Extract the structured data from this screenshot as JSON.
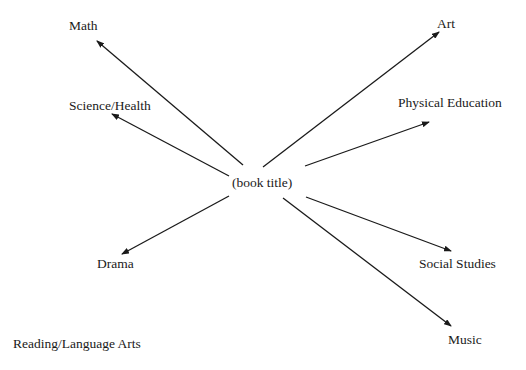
{
  "diagram": {
    "type": "web",
    "center": {
      "label": "(book title)",
      "x": 232,
      "y": 176
    },
    "nodes": [
      {
        "id": "math",
        "label": "Math",
        "x": 69,
        "y": 19
      },
      {
        "id": "science",
        "label": "Science/Health",
        "x": 69,
        "y": 99
      },
      {
        "id": "art",
        "label": "Art",
        "x": 437,
        "y": 17
      },
      {
        "id": "pe",
        "label": "Physical Education",
        "x": 398,
        "y": 96
      },
      {
        "id": "drama",
        "label": "Drama",
        "x": 97,
        "y": 257
      },
      {
        "id": "social",
        "label": "Social Studies",
        "x": 419,
        "y": 257
      },
      {
        "id": "music",
        "label": "Music",
        "x": 448,
        "y": 333
      },
      {
        "id": "reading",
        "label": "Reading/Language Arts",
        "x": 13,
        "y": 337
      }
    ],
    "edges": [
      {
        "to": "math",
        "x1": 243,
        "y1": 165,
        "x2": 97,
        "y2": 41
      },
      {
        "to": "science",
        "x1": 229,
        "y1": 176,
        "x2": 112,
        "y2": 114
      },
      {
        "to": "art",
        "x1": 263,
        "y1": 167,
        "x2": 439,
        "y2": 32
      },
      {
        "to": "pe",
        "x1": 305,
        "y1": 166,
        "x2": 429,
        "y2": 122
      },
      {
        "to": "drama",
        "x1": 229,
        "y1": 196,
        "x2": 122,
        "y2": 254
      },
      {
        "to": "social",
        "x1": 306,
        "y1": 197,
        "x2": 451,
        "y2": 251
      },
      {
        "to": "music",
        "x1": 283,
        "y1": 198,
        "x2": 451,
        "y2": 326
      }
    ],
    "line_color": "#1a1a1a"
  }
}
